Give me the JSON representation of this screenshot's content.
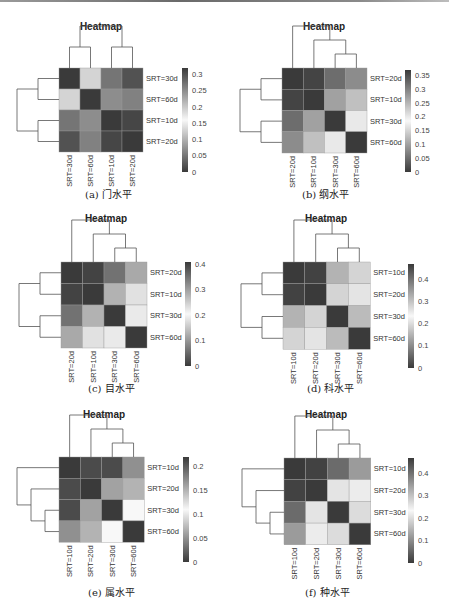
{
  "chart_data": [
    {
      "type": "heatmap",
      "panel": "a",
      "title": "Heatmap",
      "caption": "(a) 门水平",
      "rows": [
        "SRT=30d",
        "SRT=60d",
        "SRT=10d",
        "SRT=20d"
      ],
      "cols": [
        "SRT=30d",
        "SRT=60d",
        "SRT=10d",
        "SRT=20d"
      ],
      "values": [
        [
          0.0,
          0.19,
          0.05,
          0.02
        ],
        [
          0.19,
          0.0,
          0.07,
          0.06
        ],
        [
          0.05,
          0.07,
          0.0,
          0.01
        ],
        [
          0.02,
          0.06,
          0.01,
          0.0
        ]
      ],
      "colorbar": {
        "min": 0,
        "max": 0.32,
        "ticks": [
          "0.3",
          "0.25",
          "0.2",
          "0.15",
          "0.1",
          "0.05",
          "0"
        ]
      },
      "col_dendrogram": "((SRT=30d,SRT=60d),(SRT=10d,SRT=20d))",
      "row_dendrogram": "((SRT=30d,SRT=60d),(SRT=10d,SRT=20d))",
      "colormap": "diverging grayscale (dark-light-dark)"
    },
    {
      "type": "heatmap",
      "panel": "b",
      "title": "Heatmap",
      "caption": "(b) 纲水平",
      "rows": [
        "SRT=20d",
        "SRT=10d",
        "SRT=30d",
        "SRT=60d"
      ],
      "cols": [
        "SRT=20d",
        "SRT=10d",
        "SRT=30d",
        "SRT=60d"
      ],
      "values": [
        [
          0.0,
          0.01,
          0.05,
          0.08
        ],
        [
          0.01,
          0.0,
          0.1,
          0.13
        ],
        [
          0.05,
          0.1,
          0.0,
          0.17
        ],
        [
          0.08,
          0.13,
          0.17,
          0.0
        ]
      ],
      "colorbar": {
        "min": 0,
        "max": 0.37,
        "ticks": [
          "0.35",
          "0.3",
          "0.25",
          "0.2",
          "0.15",
          "0.1",
          "0.05",
          "0"
        ]
      },
      "col_dendrogram": "(SRT=20d,(SRT=10d,(SRT=30d,SRT=60d)))",
      "row_dendrogram": "((SRT=20d,SRT=10d),(SRT=30d,SRT=60d))",
      "colormap": "diverging grayscale (dark-light-dark)"
    },
    {
      "type": "heatmap",
      "panel": "c",
      "title": "Heatmap",
      "caption": "(c) 目水平",
      "rows": [
        "SRT=20d",
        "SRT=10d",
        "SRT=30d",
        "SRT=60d"
      ],
      "cols": [
        "SRT=20d",
        "SRT=10d",
        "SRT=30d",
        "SRT=60d"
      ],
      "values": [
        [
          0.0,
          0.01,
          0.06,
          0.12
        ],
        [
          0.01,
          0.0,
          0.13,
          0.18
        ],
        [
          0.06,
          0.13,
          0.0,
          0.19
        ],
        [
          0.12,
          0.18,
          0.19,
          0.0
        ]
      ],
      "colorbar": {
        "min": 0,
        "max": 0.41,
        "ticks": [
          "0.4",
          "0.3",
          "0.2",
          "0.1",
          "0"
        ]
      },
      "col_dendrogram": "(SRT=20d,(SRT=10d,(SRT=30d,SRT=60d)))",
      "row_dendrogram": "((SRT=20d,SRT=10d),(SRT=30d,SRT=60d))",
      "colormap": "diverging grayscale (dark-light-dark)"
    },
    {
      "type": "heatmap",
      "panel": "d",
      "title": "Heatmap",
      "caption": "(d) 科水平",
      "rows": [
        "SRT=10d",
        "SRT=20d",
        "SRT=30d",
        "SRT=60d"
      ],
      "cols": [
        "SRT=10d",
        "SRT=20d",
        "SRT=30d",
        "SRT=60d"
      ],
      "values": [
        [
          0.0,
          0.01,
          0.15,
          0.19
        ],
        [
          0.01,
          0.0,
          0.19,
          0.21
        ],
        [
          0.15,
          0.19,
          0.0,
          0.16
        ],
        [
          0.19,
          0.21,
          0.16,
          0.0
        ]
      ],
      "colorbar": {
        "min": 0,
        "max": 0.47,
        "ticks": [
          "0.4",
          "0.3",
          "0.2",
          "0.1",
          "0"
        ]
      },
      "col_dendrogram": "(SRT=10d,(SRT=20d,(SRT=30d,SRT=60d)))",
      "row_dendrogram": "((SRT=10d,SRT=20d),(SRT=30d,SRT=60d))",
      "colormap": "diverging grayscale (dark-light-dark)"
    },
    {
      "type": "heatmap",
      "panel": "e",
      "title": "Heatmap",
      "caption": "(e) 属水平",
      "rows": [
        "SRT=10d",
        "SRT=20d",
        "SRT=30d",
        "SRT=60d"
      ],
      "cols": [
        "SRT=10d",
        "SRT=20d",
        "SRT=30d",
        "SRT=60d"
      ],
      "values": [
        [
          0.0,
          0.01,
          0.01,
          0.05
        ],
        [
          0.01,
          0.0,
          0.06,
          0.07
        ],
        [
          0.01,
          0.06,
          0.0,
          0.11
        ],
        [
          0.05,
          0.07,
          0.11,
          0.0
        ]
      ],
      "colorbar": {
        "min": 0,
        "max": 0.22,
        "ticks": [
          "0.2",
          "0.15",
          "0.1",
          "0.05",
          "0"
        ]
      },
      "col_dendrogram": "(SRT=10d,(SRT=20d,(SRT=30d,SRT=60d)))",
      "row_dendrogram": "(SRT=10d,(SRT=20d,(SRT=30d,SRT=60d)))",
      "colormap": "diverging grayscale (dark-light-dark)"
    },
    {
      "type": "heatmap",
      "panel": "f",
      "title": "Heatmap",
      "caption": "(f) 种水平",
      "rows": [
        "SRT=10d",
        "SRT=20d",
        "SRT=30d",
        "SRT=60d"
      ],
      "cols": [
        "SRT=10d",
        "SRT=20d",
        "SRT=30d",
        "SRT=60d"
      ],
      "values": [
        [
          0.0,
          0.01,
          0.06,
          0.12
        ],
        [
          0.01,
          0.0,
          0.21,
          0.22
        ],
        [
          0.06,
          0.21,
          0.0,
          0.2
        ],
        [
          0.12,
          0.22,
          0.2,
          0.0
        ]
      ],
      "colorbar": {
        "min": 0,
        "max": 0.47,
        "ticks": [
          "0.4",
          "0.3",
          "0.2",
          "0.1",
          "0"
        ]
      },
      "col_dendrogram": "(SRT=10d,(SRT=20d,(SRT=30d,SRT=60d)))",
      "row_dendrogram": "(SRT=10d,(SRT=20d,(SRT=30d,SRT=60d)))",
      "colormap": "diverging grayscale (dark-light-dark)"
    }
  ],
  "layout": {
    "panels": [
      {
        "id": "a",
        "grid": [
          59,
          68
        ],
        "cell": 21,
        "cbar": [
          182,
          68,
          104
        ],
        "caption_pos": [
          85,
          186
        ],
        "title_x": 101,
        "title_y": 30
      },
      {
        "id": "b",
        "grid": [
          282,
          68
        ],
        "cell": 21.25,
        "cbar": [
          405,
          70,
          102
        ],
        "caption_pos": [
          302,
          186
        ],
        "title_x": 324,
        "title_y": 30
      },
      {
        "id": "c",
        "grid": [
          61,
          262
        ],
        "cell": 21.5,
        "cbar": [
          185,
          262,
          104
        ],
        "caption_pos": [
          88,
          380
        ],
        "title_x": 106,
        "title_y": 222
      },
      {
        "id": "d",
        "grid": [
          283,
          262
        ],
        "cell": 21.8,
        "cbar": [
          408,
          264,
          104
        ],
        "caption_pos": [
          307,
          380
        ],
        "title_x": 326,
        "title_y": 222
      },
      {
        "id": "e",
        "grid": [
          59,
          457
        ],
        "cell": 21.3,
        "cbar": [
          183,
          457,
          105
        ],
        "caption_pos": [
          88,
          584
        ],
        "title_x": 104,
        "title_y": 418
      },
      {
        "id": "f",
        "grid": [
          284,
          458
        ],
        "cell": 21.7,
        "cbar": [
          408,
          458,
          105
        ],
        "caption_pos": [
          305,
          584
        ],
        "title_x": 326,
        "title_y": 418
      }
    ]
  }
}
